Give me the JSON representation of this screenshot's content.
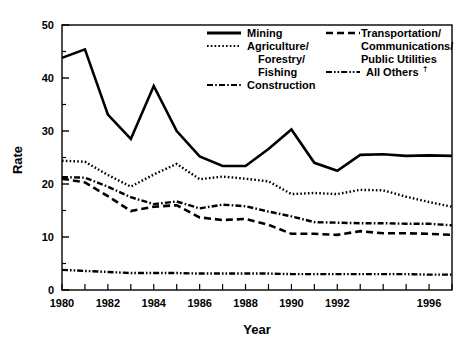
{
  "chart_data": {
    "type": "line",
    "title": "",
    "xlabel": "Year",
    "ylabel": "Rate",
    "xlim": [
      1980,
      1997
    ],
    "ylim": [
      0,
      50
    ],
    "ytick_values": [
      0,
      10,
      20,
      30,
      40,
      50
    ],
    "ytick_labels": [
      "0",
      "10",
      "20",
      "30",
      "40",
      "50"
    ],
    "yminor_step": 5,
    "xtick_values": [
      1980,
      1981,
      1982,
      1983,
      1984,
      1985,
      1986,
      1987,
      1988,
      1989,
      1990,
      1991,
      1992,
      1993,
      1994,
      1995,
      1996,
      1997
    ],
    "xtick_labels": [
      "1980",
      "",
      "1982",
      "",
      "1984",
      "",
      "1986",
      "",
      "1988",
      "",
      "1990",
      "",
      "1992",
      "",
      "",
      "",
      "1996",
      ""
    ],
    "grid": false,
    "legend_position": "top-center",
    "x": [
      1980,
      1981,
      1982,
      1983,
      1984,
      1985,
      1986,
      1987,
      1988,
      1989,
      1990,
      1991,
      1992,
      1993,
      1994,
      1995,
      1996,
      1997
    ],
    "series": [
      {
        "name": "Mining",
        "style": "solid",
        "color": "#000000",
        "values": [
          43.8,
          45.4,
          33.1,
          28.5,
          38.5,
          30.0,
          25.2,
          23.4,
          23.4,
          26.6,
          30.3,
          24.0,
          22.5,
          25.5,
          25.6,
          25.3,
          25.4,
          25.3
        ]
      },
      {
        "name": "Agriculture/ Forestry/ Fishing",
        "style": "dotted",
        "color": "#000000",
        "values": [
          24.4,
          24.2,
          21.7,
          19.5,
          21.8,
          23.8,
          20.9,
          21.4,
          21.0,
          20.5,
          18.1,
          18.3,
          18.1,
          18.9,
          18.8,
          17.6,
          16.6,
          15.7
        ]
      },
      {
        "name": "Construction",
        "style": "dashdot",
        "color": "#000000",
        "values": [
          21.3,
          21.2,
          19.5,
          17.5,
          16.2,
          16.7,
          15.4,
          16.1,
          15.8,
          14.8,
          13.9,
          12.8,
          12.7,
          12.6,
          12.6,
          12.5,
          12.5,
          12.2
        ]
      },
      {
        "name": "Transportation/ Communications/ Public Utilities",
        "style": "dashed",
        "color": "#000000",
        "values": [
          21.0,
          20.3,
          17.7,
          14.9,
          15.7,
          16.0,
          13.7,
          13.2,
          13.4,
          12.3,
          10.6,
          10.6,
          10.4,
          11.1,
          10.7,
          10.7,
          10.6,
          10.4
        ]
      },
      {
        "name": "All Others",
        "style": "dashdotdot",
        "color": "#000000",
        "values": [
          3.8,
          3.6,
          3.4,
          3.2,
          3.2,
          3.2,
          3.1,
          3.1,
          3.1,
          3.1,
          3.0,
          3.0,
          3.0,
          3.0,
          3.0,
          3.0,
          2.9,
          2.9
        ]
      }
    ],
    "legend_entries": [
      {
        "label": "Mining",
        "style": "solid",
        "column": "left"
      },
      {
        "label": "Agriculture/",
        "label2": "Forestry/",
        "label3": "Fishing",
        "style": "dotted",
        "column": "left"
      },
      {
        "label": "Construction",
        "style": "dashdot",
        "column": "left"
      },
      {
        "label": "Transportation/",
        "label2": "Communications/",
        "label3": "Public Utilities",
        "style": "dashed",
        "column": "right"
      },
      {
        "label": "All Others",
        "suffix": "†",
        "style": "dashdotdot",
        "column": "right"
      }
    ]
  },
  "labels": {
    "ylabel": "Rate",
    "xlabel": "Year",
    "y_0": "0",
    "y_10": "10",
    "y_20": "20",
    "y_30": "30",
    "y_40": "40",
    "y_50": "50",
    "x_1980": "1980",
    "x_1982": "1982",
    "x_1984": "1984",
    "x_1986": "1986",
    "x_1988": "1988",
    "x_1990": "1990",
    "x_1992": "1992",
    "x_1996": "1996",
    "legend_mining": "Mining",
    "legend_agriculture_1": "Agriculture/",
    "legend_agriculture_2": "Forestry/",
    "legend_agriculture_3": "Fishing",
    "legend_construction": "Construction",
    "legend_transport_1": "Transportation/",
    "legend_transport_2": "Communications/",
    "legend_transport_3": "Public Utilities",
    "legend_allothers": "All Others",
    "legend_allothers_dagger": "†"
  }
}
